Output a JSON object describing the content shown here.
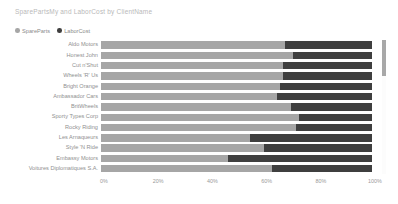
{
  "chart": {
    "title": "SparePartsMy and LaborCost by ClientName"
  },
  "legend": {
    "position": "top-left",
    "items": [
      {
        "label": "SpareParts",
        "color": "#a6a6a6",
        "icon": "legend-dot-icon"
      },
      {
        "label": "LaborCost",
        "color": "#3f3f3f",
        "icon": "legend-dot-icon"
      }
    ]
  },
  "scrollbar": {
    "name": "vertical-scrollbar",
    "thumb_color": "#a8a8a8",
    "track_color": "#fcfcfc"
  },
  "chart_data": {
    "type": "bar",
    "orientation": "horizontal",
    "stacked": true,
    "normalized": true,
    "title": "SparePartsMy and LaborCost by ClientName",
    "xlabel": "",
    "ylabel": "",
    "xlim": [
      0,
      100
    ],
    "xticks": [
      "0%",
      "20%",
      "40%",
      "60%",
      "80%",
      "100%"
    ],
    "xtick_values": [
      0,
      20,
      40,
      60,
      80,
      100
    ],
    "grid": false,
    "legend_position": "top-left",
    "categories": [
      "Aldo Motors",
      "Honest John",
      "Cut n'Shut",
      "Wheels 'R' Us",
      "Bright Orange",
      "Ambassador Cars",
      "BritWheels",
      "Sporty Types Corp",
      "Rocky Riding",
      "Les Arnaqueurs",
      "Style 'N Ride",
      "Embassy Motors",
      "Voitures Diplomatiques S.A."
    ],
    "series": [
      {
        "name": "SpareParts",
        "color": "#a6a6a6",
        "values": [
          68,
          71,
          67,
          67,
          66,
          65,
          70,
          73,
          72,
          55,
          60,
          47,
          63
        ]
      },
      {
        "name": "LaborCost",
        "color": "#3f3f3f",
        "values": [
          32,
          29,
          33,
          33,
          34,
          35,
          30,
          27,
          28,
          45,
          40,
          53,
          37
        ]
      }
    ]
  }
}
